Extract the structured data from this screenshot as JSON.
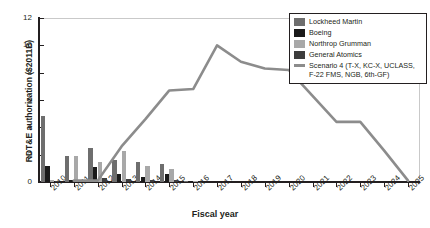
{
  "chart_data": {
    "type": "bar",
    "title": "",
    "xlabel": "Fiscal year",
    "ylabel": "RDT&E authorization ($2011B)",
    "ylim": [
      0,
      12
    ],
    "yticks": [
      0,
      2,
      4,
      6,
      8,
      10,
      12
    ],
    "grid": false,
    "legend_position": "top-right",
    "categories": [
      "2010",
      "2011",
      "2012",
      "2013",
      "2014",
      "2015",
      "2016",
      "2017",
      "2018",
      "2019",
      "2020",
      "2021",
      "2022",
      "2023",
      "2024",
      "2025"
    ],
    "series": [
      {
        "name": "Lockheed Martin",
        "color": "#6e6e6e",
        "values": [
          4.8,
          1.9,
          2.5,
          1.6,
          1.5,
          1.3,
          0.08,
          0,
          0,
          0,
          0,
          0,
          0,
          0,
          0,
          0
        ]
      },
      {
        "name": "Boeing",
        "color": "#1a1a1a",
        "values": [
          1.2,
          0.15,
          1.1,
          0.55,
          0.35,
          0.55,
          0.05,
          0,
          0,
          0,
          0,
          0,
          0,
          0,
          0,
          0
        ]
      },
      {
        "name": "Northrop Grumman",
        "color": "#a8a8a8",
        "values": [
          0.12,
          1.9,
          1.5,
          2.3,
          1.15,
          0.95,
          0.04,
          0,
          0,
          0,
          0,
          0,
          0,
          0,
          0,
          0
        ]
      },
      {
        "name": "General Atomics",
        "color": "#3d3d3d",
        "values": [
          0.1,
          0.12,
          0.3,
          0.22,
          0.15,
          0.12,
          0.03,
          0,
          0,
          0,
          0,
          0,
          0,
          0,
          0,
          0
        ]
      }
    ],
    "line_series": {
      "name": "Scenario 4 (T-X, KC-X, UCLASS, F-22 FMS, NGB, 6th-GF)",
      "color": "#8c8c8c",
      "x": [
        "2011",
        "2012",
        "2013",
        "2014",
        "2015",
        "2016",
        "2017",
        "2018",
        "2019",
        "2020",
        "2021",
        "2022",
        "2023",
        "2024",
        "2025"
      ],
      "values": [
        0.1,
        0.1,
        2.6,
        4.6,
        6.7,
        6.8,
        10.0,
        8.8,
        8.3,
        8.2,
        6.3,
        4.4,
        4.4,
        2.3,
        0.1
      ]
    }
  },
  "legend": {
    "items": [
      {
        "label": "Lockheed Martin",
        "swatch": "swatch-lockheed-martin",
        "type": "box"
      },
      {
        "label": "Boeing",
        "swatch": "swatch-boeing",
        "type": "box"
      },
      {
        "label": "Northrop Grumman",
        "swatch": "swatch-northrop-grumman",
        "type": "box"
      },
      {
        "label": "General Atomics",
        "swatch": "swatch-general-atomics",
        "type": "box"
      },
      {
        "label": "Scenario 4 (T-X, KC-X, UCLASS, F-22 FMS, NGB, 6th-GF)",
        "swatch": "swatch-scenario-4",
        "type": "line"
      }
    ]
  },
  "colors": {
    "axis": "#231f20",
    "frame": "#c9c9c9",
    "background": "#ffffff"
  }
}
